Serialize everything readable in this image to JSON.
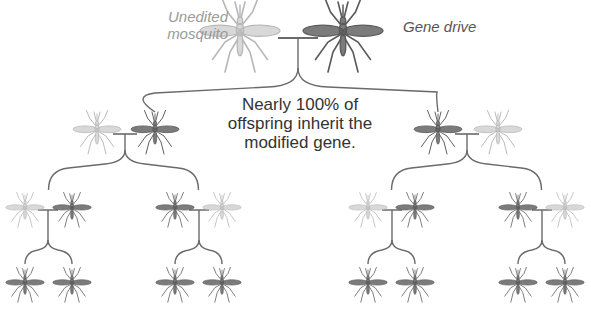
{
  "diagram": {
    "labels": {
      "unedited_line1": "Unedited",
      "unedited_line2": "mosquito",
      "gene_drive": "Gene drive",
      "caption_line1": "Nearly 100% of",
      "caption_line2": "offspring inherit the",
      "caption_line3": "modified gene."
    },
    "colors": {
      "unedited": "#b8b8b8",
      "gene_drive": "#5a5a5a",
      "connector": "#6a6a6a",
      "label_light": "#9a9a9a",
      "label_dark": "#555555",
      "caption": "#333333"
    },
    "generations": [
      {
        "level": 1,
        "pairs": [
          {
            "parents": [
              {
                "type": "unedited",
                "x": 240,
                "y": 32,
                "scale": 1.25
              },
              {
                "type": "gene_drive",
                "x": 343,
                "y": 32,
                "scale": 1.25
              }
            ],
            "cross_x": 298,
            "cross_y": 38
          }
        ]
      },
      {
        "level": 2,
        "pairs": [
          {
            "parents": [
              {
                "type": "unedited",
                "x": 97,
                "y": 130,
                "scale": 0.75
              },
              {
                "type": "gene_drive",
                "x": 155,
                "y": 130,
                "scale": 0.75
              }
            ],
            "cross_x": 125,
            "cross_y": 134
          },
          {
            "parents": [
              {
                "type": "gene_drive",
                "x": 438,
                "y": 130,
                "scale": 0.75
              },
              {
                "type": "unedited",
                "x": 498,
                "y": 130,
                "scale": 0.75
              }
            ],
            "cross_x": 467,
            "cross_y": 134
          }
        ]
      },
      {
        "level": 3,
        "pairs": [
          {
            "parents": [
              {
                "type": "unedited",
                "x": 25,
                "y": 208,
                "scale": 0.6
              },
              {
                "type": "gene_drive",
                "x": 72,
                "y": 208,
                "scale": 0.6
              }
            ],
            "cross_x": 48,
            "cross_y": 210,
            "children": [
              {
                "type": "gene_drive",
                "x": 25,
                "y": 283,
                "scale": 0.6
              },
              {
                "type": "gene_drive",
                "x": 72,
                "y": 283,
                "scale": 0.6
              }
            ]
          },
          {
            "parents": [
              {
                "type": "gene_drive",
                "x": 175,
                "y": 208,
                "scale": 0.6
              },
              {
                "type": "unedited",
                "x": 222,
                "y": 208,
                "scale": 0.6
              }
            ],
            "cross_x": 199,
            "cross_y": 210,
            "children": [
              {
                "type": "gene_drive",
                "x": 175,
                "y": 283,
                "scale": 0.6
              },
              {
                "type": "gene_drive",
                "x": 222,
                "y": 283,
                "scale": 0.6
              }
            ]
          },
          {
            "parents": [
              {
                "type": "unedited",
                "x": 368,
                "y": 208,
                "scale": 0.6
              },
              {
                "type": "gene_drive",
                "x": 415,
                "y": 208,
                "scale": 0.6
              }
            ],
            "cross_x": 392,
            "cross_y": 210,
            "children": [
              {
                "type": "gene_drive",
                "x": 368,
                "y": 283,
                "scale": 0.6
              },
              {
                "type": "gene_drive",
                "x": 415,
                "y": 283,
                "scale": 0.6
              }
            ]
          },
          {
            "parents": [
              {
                "type": "gene_drive",
                "x": 518,
                "y": 208,
                "scale": 0.6
              },
              {
                "type": "unedited",
                "x": 565,
                "y": 208,
                "scale": 0.6
              }
            ],
            "cross_x": 542,
            "cross_y": 210,
            "children": [
              {
                "type": "gene_drive",
                "x": 518,
                "y": 283,
                "scale": 0.6
              },
              {
                "type": "gene_drive",
                "x": 565,
                "y": 283,
                "scale": 0.6
              }
            ]
          }
        ]
      }
    ]
  }
}
